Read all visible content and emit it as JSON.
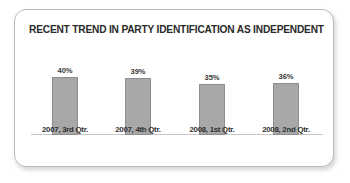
{
  "card": {
    "background_color": "#ffffff",
    "border_color": "#b9b9b9"
  },
  "chart_data": {
    "type": "bar",
    "title": "RECENT TREND IN PARTY IDENTIFICATION AS INDEPENDENT",
    "xlabel": "",
    "ylabel": "",
    "ylim": [
      0,
      45
    ],
    "grid": false,
    "legend": false,
    "bar_color": "#a8a8a8",
    "bar_border_color": "#8d8d8d",
    "axis_line_color": "#c6c6c6",
    "categories": [
      "2007, 3rd Qtr.",
      "2007, 4th Qtr.",
      "2008, 1st Qtr.",
      "2008, 2nd Qtr."
    ],
    "values": [
      40,
      39,
      35,
      36
    ],
    "value_labels": [
      "40%",
      "39%",
      "35%",
      "36%"
    ]
  }
}
